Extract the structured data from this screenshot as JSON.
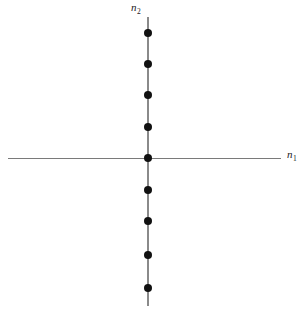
{
  "figure": {
    "background_color": "#ffffff",
    "width": 304,
    "height": 313,
    "axis_color": "#7a7a7a",
    "point_color": "#111111"
  },
  "axes": {
    "horizontal": {
      "name": "n",
      "subscript": "1",
      "label": "n₁",
      "x_start": 8,
      "x_end": 281,
      "y": 158
    },
    "vertical": {
      "name": "n",
      "subscript": "2",
      "label": "n₂",
      "x": 148,
      "y_start": 17,
      "y_end": 306
    }
  },
  "chart_data": {
    "type": "scatter",
    "title": "",
    "subtitle": "",
    "xlabel": "n₁",
    "ylabel": "n₂",
    "xlim": [
      -4.45,
      4.25
    ],
    "ylim": [
      -4.15,
      4.5
    ],
    "grid": false,
    "legend": null,
    "marker": "filled-circle",
    "marker_size_px": 8,
    "marker_color": "#111111",
    "points": [
      {
        "n1": 0,
        "n2": 4,
        "px": 148,
        "py": 33
      },
      {
        "n1": 0,
        "n2": 3,
        "px": 148,
        "py": 64
      },
      {
        "n1": 0,
        "n2": 2,
        "px": 148,
        "py": 95
      },
      {
        "n1": 0,
        "n2": 1,
        "px": 148,
        "py": 127
      },
      {
        "n1": 0,
        "n2": 0,
        "px": 148,
        "py": 158
      },
      {
        "n1": 0,
        "n2": -1,
        "px": 148,
        "py": 190
      },
      {
        "n1": 0,
        "n2": -2,
        "px": 148,
        "py": 221
      },
      {
        "n1": 0,
        "n2": -3,
        "px": 148,
        "py": 255
      },
      {
        "n1": 0,
        "n2": -4,
        "px": 148,
        "py": 288
      }
    ],
    "x": [
      0,
      0,
      0,
      0,
      0,
      0,
      0,
      0,
      0
    ],
    "y": [
      4,
      3,
      2,
      1,
      0,
      -1,
      -2,
      -3,
      -4
    ]
  }
}
